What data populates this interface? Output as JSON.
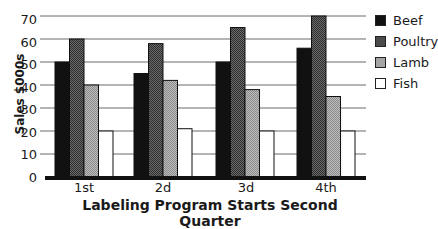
{
  "chart_data": {
    "type": "bar",
    "title": "",
    "xlabel": "Labeling Program Starts Second Quarter",
    "ylabel": "Sales $000s",
    "categories": [
      "1st",
      "2d",
      "3d",
      "4th"
    ],
    "series": [
      {
        "name": "Beef",
        "values": [
          50,
          45,
          50,
          56
        ],
        "color": "#111111"
      },
      {
        "name": "Poultry",
        "values": [
          60,
          58,
          65,
          70
        ],
        "color": "#555555"
      },
      {
        "name": "Lamb",
        "values": [
          40,
          42,
          38,
          35
        ],
        "color": "#a8a8a8"
      },
      {
        "name": "Fish",
        "values": [
          20,
          21,
          20,
          20
        ],
        "color": "#ffffff"
      }
    ],
    "ylim": [
      0,
      70
    ],
    "yticks": [
      0,
      10,
      20,
      30,
      40,
      50,
      60,
      70
    ],
    "grid": true,
    "legend_position": "right"
  },
  "labels": {
    "xlabel": "Labeling Program Starts Second Quarter",
    "ylabel": "Sales $000s",
    "yticks": [
      "0",
      "10",
      "20",
      "30",
      "40",
      "50",
      "60",
      "70"
    ],
    "categories": [
      "1st",
      "2d",
      "3d",
      "4th"
    ],
    "legend": [
      "Beef",
      "Poultry",
      "Lamb",
      "Fish"
    ]
  }
}
